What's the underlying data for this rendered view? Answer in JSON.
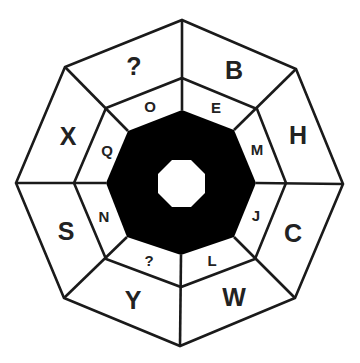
{
  "puzzle": {
    "description": "Octagonal letter puzzle with two rings of segments",
    "outer_ring": [
      {
        "position": "top-right",
        "label": "B"
      },
      {
        "position": "right-upper",
        "label": "H"
      },
      {
        "position": "right-lower",
        "label": "C"
      },
      {
        "position": "bottom-right",
        "label": "W"
      },
      {
        "position": "bottom-left",
        "label": "Y"
      },
      {
        "position": "left-lower",
        "label": "S"
      },
      {
        "position": "left-upper",
        "label": "X"
      },
      {
        "position": "top-left",
        "label": "?"
      }
    ],
    "inner_ring": [
      {
        "position": "top-right",
        "label": "E"
      },
      {
        "position": "right-upper",
        "label": "M"
      },
      {
        "position": "right-lower",
        "label": "J"
      },
      {
        "position": "bottom-right",
        "label": "L"
      },
      {
        "position": "bottom-left",
        "label": "?"
      },
      {
        "position": "left-lower",
        "label": "N"
      },
      {
        "position": "left-upper",
        "label": "Q"
      },
      {
        "position": "top-left",
        "label": "O"
      }
    ],
    "colors": {
      "line": "#1a1a1a",
      "center_fill": "#000000",
      "background": "#ffffff",
      "text": "#222222"
    }
  }
}
